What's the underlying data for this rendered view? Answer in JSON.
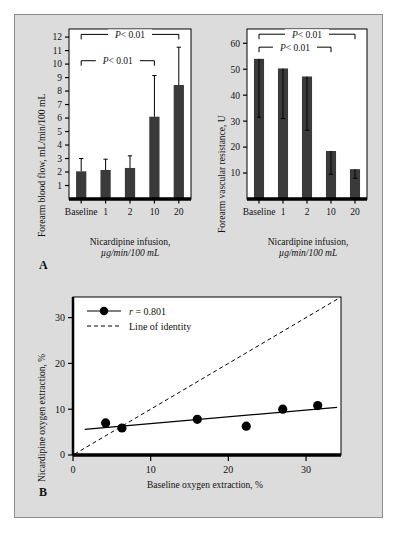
{
  "figure": {
    "background_color": "#dcdcdc",
    "border_color": "#8d8d8d",
    "bar_color": "#3a3a3a",
    "plot_background": "#ffffff",
    "axis_color": "#000000",
    "panel_a_letter": "A",
    "panel_b_letter": "B"
  },
  "chart_data": [
    {
      "type": "bar",
      "id": "forearm-blood-flow",
      "title": "",
      "ylabel": "Forearm blood flow, ",
      "ylabel_italic": "mL/min/100 mL",
      "xlabel_line1": "Nicardipine infusion,",
      "xlabel_line2": "µg/min/100 mL",
      "categories": [
        "Baseline",
        "1",
        "2",
        "10",
        "20"
      ],
      "values": [
        2.05,
        2.15,
        2.3,
        6.1,
        8.45
      ],
      "err_upper": [
        3.0,
        2.95,
        3.2,
        9.15,
        11.25
      ],
      "ylim": [
        0,
        12.6
      ],
      "yticks": [
        1,
        2,
        3,
        4,
        5,
        6,
        7,
        8,
        9,
        10,
        11,
        12
      ],
      "ytick_labels": [
        "1",
        "2",
        "3",
        "4",
        "5",
        "6",
        "7",
        "8",
        "9",
        "10",
        "11",
        "12"
      ],
      "grid": false,
      "annotations": [
        {
          "label": "P",
          "operator": "< 0.01",
          "from": 0,
          "to": 4,
          "y": 12.2
        },
        {
          "label": "P",
          "operator": "< 0.01",
          "from": 0,
          "to": 3,
          "y": 10.25
        }
      ]
    },
    {
      "type": "bar",
      "id": "forearm-vascular-resistance",
      "title": "",
      "ylabel": "Forearm vascular resistance, ",
      "ylabel_italic": "U",
      "xlabel_line1": "Nicardipine infusion,",
      "xlabel_line2": "µg/min/100 mL",
      "categories": [
        "Baseline",
        "1",
        "2",
        "10",
        "20"
      ],
      "values": [
        54.0,
        50.3,
        47.2,
        18.5,
        11.5
      ],
      "err_lower": [
        31.5,
        31.0,
        26.5,
        9.5,
        8.0
      ],
      "ylim": [
        0,
        65.5
      ],
      "yticks": [
        10,
        20,
        30,
        40,
        50,
        60
      ],
      "ytick_labels": [
        "10",
        "20",
        "30",
        "40",
        "50",
        "60"
      ],
      "grid": false,
      "annotations": [
        {
          "label": "P",
          "operator": "< 0.01",
          "from": 0,
          "to": 4,
          "y": 63.5
        },
        {
          "label": "P",
          "operator": "< 0.01",
          "from": 0,
          "to": 3,
          "y": 58.5
        }
      ]
    },
    {
      "type": "scatter",
      "id": "oxygen-extraction",
      "title": "",
      "xlabel": "Baseline oxygen extraction, %",
      "ylabel": "Nicardipine oxygen extraction, %",
      "x": [
        4.2,
        6.3,
        16.0,
        22.3,
        27.0,
        31.5
      ],
      "y": [
        7.0,
        5.9,
        7.8,
        6.3,
        10.0,
        10.8
      ],
      "xlim": [
        0,
        34.5
      ],
      "ylim": [
        0,
        34.5
      ],
      "xticks": [
        0,
        10,
        20,
        30
      ],
      "xtick_labels": [
        "0",
        "10",
        "20",
        "30"
      ],
      "yticks": [
        0,
        10,
        20,
        30
      ],
      "ytick_labels": [
        "0",
        "10",
        "20",
        "30"
      ],
      "grid": false,
      "fit_line": {
        "x0": 1.5,
        "y0": 5.6,
        "x1": 34.0,
        "y1": 10.4
      },
      "identity_line": {
        "x0": 0.2,
        "y0": 0.2,
        "x1": 34.4,
        "y1": 34.4
      },
      "legend_position": "top-left",
      "legend": [
        {
          "marker": "line-dot",
          "text_italic": "r",
          "text": " = 0.801"
        },
        {
          "marker": "dashed",
          "text_italic": "",
          "text": "Line of identity"
        }
      ]
    }
  ]
}
